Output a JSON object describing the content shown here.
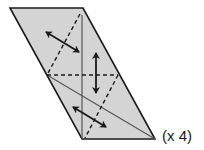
{
  "diagram": {
    "type": "folding-diagram",
    "shape": "parallelogram",
    "fill_color": "#d4d4d4",
    "stroke_color": "#1a1a1a",
    "thin_line_color": "#555555",
    "outline": [
      [
        10,
        8
      ],
      [
        83,
        8
      ],
      [
        155,
        139
      ],
      [
        82,
        139
      ]
    ],
    "solid_lines": [
      {
        "name": "vertical-crease",
        "from": [
          82,
          15
        ],
        "to": [
          82,
          139
        ]
      },
      {
        "name": "diagonal-crease",
        "from": [
          47,
          75
        ],
        "to": [
          155,
          139
        ]
      }
    ],
    "dashed_lines": [
      {
        "name": "horizontal-fold",
        "from": [
          47,
          75
        ],
        "to": [
          118,
          75
        ]
      },
      {
        "name": "upper-diagonal-fold",
        "from": [
          80,
          14
        ],
        "to": [
          47,
          75
        ]
      },
      {
        "name": "lower-diagonal-fold",
        "from": [
          118,
          75
        ],
        "to": [
          85,
          138
        ]
      }
    ],
    "arrows": [
      {
        "name": "upper-double-arrow",
        "from": [
          46,
          32
        ],
        "to": [
          79,
          52
        ]
      },
      {
        "name": "middle-vertical-double-arrow",
        "from": [
          96,
          53
        ],
        "to": [
          96,
          93
        ]
      },
      {
        "name": "lower-double-arrow",
        "from": [
          73,
          107
        ],
        "to": [
          106,
          127
        ]
      }
    ]
  },
  "label": {
    "multiplier_text": "(x 4)"
  }
}
